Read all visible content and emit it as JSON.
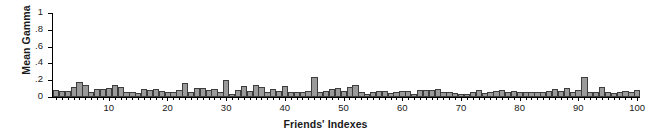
{
  "chart_data": {
    "type": "bar",
    "title": "",
    "xlabel": "Friends' Indexes",
    "ylabel": "Mean Gamma",
    "xlim": [
      0.5,
      100.5
    ],
    "ylim": [
      0,
      1
    ],
    "grid": false,
    "legend": null,
    "ytick_labels": [
      "0",
      ".2",
      ".4",
      ".6",
      ".8",
      "1"
    ],
    "ytick_values": [
      0,
      0.2,
      0.4,
      0.6,
      0.8,
      1
    ],
    "xtick_labels": [
      "10",
      "20",
      "30",
      "40",
      "50",
      "60",
      "70",
      "80",
      "90",
      "100"
    ],
    "xtick_values": [
      10,
      20,
      30,
      40,
      50,
      60,
      70,
      80,
      90,
      100
    ],
    "bar_color": "#9a9a9a",
    "bar_edge_color": "#3d3d3d",
    "categories": [
      1,
      2,
      3,
      4,
      5,
      6,
      7,
      8,
      9,
      10,
      11,
      12,
      13,
      14,
      15,
      16,
      17,
      18,
      19,
      20,
      21,
      22,
      23,
      24,
      25,
      26,
      27,
      28,
      29,
      30,
      31,
      32,
      33,
      34,
      35,
      36,
      37,
      38,
      39,
      40,
      41,
      42,
      43,
      44,
      45,
      46,
      47,
      48,
      49,
      50,
      51,
      52,
      53,
      54,
      55,
      56,
      57,
      58,
      59,
      60,
      61,
      62,
      63,
      64,
      65,
      66,
      67,
      68,
      69,
      70,
      71,
      72,
      73,
      74,
      75,
      76,
      77,
      78,
      79,
      80,
      81,
      82,
      83,
      84,
      85,
      86,
      87,
      88,
      89,
      90,
      91,
      92,
      93,
      94,
      95,
      96,
      97,
      98,
      99,
      100
    ],
    "values": [
      0.085,
      0.07,
      0.075,
      0.12,
      0.175,
      0.14,
      0.055,
      0.1,
      0.095,
      0.105,
      0.14,
      0.115,
      0.065,
      0.055,
      0.05,
      0.095,
      0.08,
      0.09,
      0.07,
      0.06,
      0.06,
      0.085,
      0.165,
      0.06,
      0.11,
      0.105,
      0.085,
      0.095,
      0.065,
      0.205,
      0.035,
      0.08,
      0.135,
      0.07,
      0.14,
      0.125,
      0.055,
      0.095,
      0.07,
      0.13,
      0.06,
      0.065,
      0.06,
      0.07,
      0.235,
      0.055,
      0.07,
      0.09,
      0.11,
      0.075,
      0.12,
      0.145,
      0.06,
      0.04,
      0.065,
      0.07,
      0.075,
      0.05,
      0.06,
      0.075,
      0.07,
      0.04,
      0.08,
      0.085,
      0.08,
      0.09,
      0.065,
      0.055,
      0.045,
      0.03,
      0.035,
      0.06,
      0.085,
      0.05,
      0.055,
      0.07,
      0.08,
      0.06,
      0.07,
      0.06,
      0.055,
      0.06,
      0.06,
      0.055,
      0.075,
      0.095,
      0.07,
      0.105,
      0.06,
      0.08,
      0.24,
      0.065,
      0.055,
      0.125,
      0.06,
      0.045,
      0.055,
      0.075,
      0.06,
      0.08
    ]
  }
}
